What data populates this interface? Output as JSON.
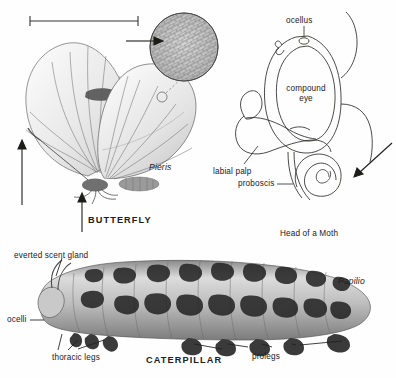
{
  "figure": {
    "background_color": "#fefefe",
    "ink_color": "#20201e",
    "art_gray": "#8e8e8e",
    "panels": [
      "butterfly",
      "head-of-a-moth",
      "caterpillar"
    ]
  },
  "butterfly_panel": {
    "caption": "BUTTERFLY",
    "genus": "Pieris",
    "scale_bar": {
      "present": true,
      "label": ""
    },
    "inset": {
      "name": "wing-scales-magnified",
      "shape": "circle"
    },
    "arrows": [
      {
        "name": "antenna-arrow",
        "direction": "up"
      },
      {
        "name": "legs-arrow",
        "direction": "up"
      },
      {
        "name": "scale-inset-arrow",
        "direction": "left"
      }
    ]
  },
  "moth_panel": {
    "caption": "Head of a Moth",
    "labels": {
      "ocellus": "ocellus",
      "compound_eye_line1": "compound",
      "compound_eye_line2": "eye",
      "labial_palp": "labial palp",
      "proboscis": "proboscis"
    },
    "arrows": [
      {
        "name": "proboscis-coil-arrow",
        "direction": "down-left"
      }
    ]
  },
  "caterpillar_panel": {
    "caption": "CATERPILLAR",
    "genus": "Papilio",
    "labels": {
      "everted_scent_gland": "everted scent gland",
      "ocelli": "ocelli",
      "thoracic_legs": "thoracic legs",
      "prolegs": "prolegs"
    }
  }
}
